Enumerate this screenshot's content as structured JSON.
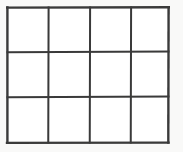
{
  "figure": {
    "kind": "grid-table-outline",
    "columns": 4,
    "rows": 3,
    "cell_count": 12,
    "background_color": "#f9f9f8",
    "cell_fill_color": "#ffffff",
    "line_color": "#3a3a3a",
    "line_width": 2,
    "outer_border_width": 2.4,
    "geometry": {
      "x_lines": [
        7.5,
        48.5,
        90.0,
        131.0,
        168.5
      ],
      "y_lines": [
        7.5,
        52.0,
        97.0,
        142.5
      ],
      "left": 7.5,
      "top": 7.5,
      "right": 168.5,
      "bottom": 142.5,
      "width": 161,
      "height": 135
    },
    "cells": [
      {
        "row": 0,
        "col": 0,
        "label": ""
      },
      {
        "row": 0,
        "col": 1,
        "label": ""
      },
      {
        "row": 0,
        "col": 2,
        "label": ""
      },
      {
        "row": 0,
        "col": 3,
        "label": ""
      },
      {
        "row": 1,
        "col": 0,
        "label": ""
      },
      {
        "row": 1,
        "col": 1,
        "label": ""
      },
      {
        "row": 1,
        "col": 2,
        "label": ""
      },
      {
        "row": 1,
        "col": 3,
        "label": ""
      },
      {
        "row": 2,
        "col": 0,
        "label": ""
      },
      {
        "row": 2,
        "col": 1,
        "label": ""
      },
      {
        "row": 2,
        "col": 2,
        "label": ""
      },
      {
        "row": 2,
        "col": 3,
        "label": ""
      }
    ]
  }
}
